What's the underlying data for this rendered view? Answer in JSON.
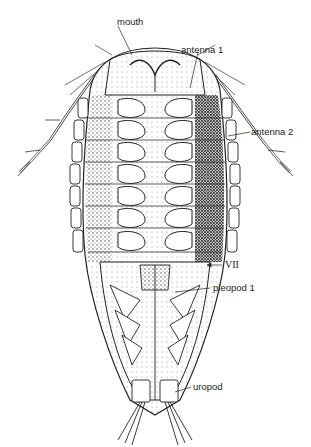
{
  "figure": {
    "labels": [
      {
        "id": "mouth",
        "text": "mouth",
        "x": 141,
        "y": 15
      },
      {
        "id": "antenna1",
        "text": "antenna 1",
        "x": 181,
        "y": 44
      },
      {
        "id": "antenna2",
        "text": "antenna 2",
        "x": 251,
        "y": 127
      },
      {
        "id": "segment7",
        "text": "VII",
        "x": 225,
        "y": 260
      },
      {
        "id": "pleopod1",
        "text": "pleopod 1",
        "x": 212,
        "y": 283
      },
      {
        "id": "uropod",
        "text": "uropod",
        "x": 193,
        "y": 382
      }
    ],
    "colors": {
      "ink": "#222222",
      "shade": "#555555",
      "background": "#ffffff"
    }
  }
}
